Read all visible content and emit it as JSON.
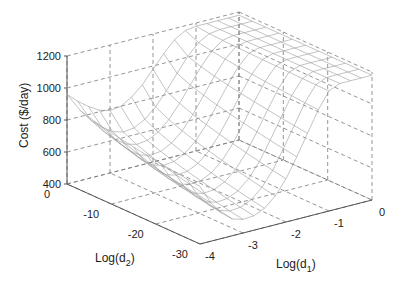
{
  "chart_data": {
    "type": "surface3d",
    "title": "",
    "xlabel": "Log(d1)",
    "ylabel": "Log(d2)",
    "zlabel": "Cost ($/day)",
    "xlabel_parts": {
      "base": "Log(d",
      "sub": "1",
      "close": ")"
    },
    "ylabel_parts": {
      "base": "Log(d",
      "sub": "2",
      "close": ")"
    },
    "xlim": [
      -4,
      0
    ],
    "ylim": [
      -30,
      0
    ],
    "zlim": [
      400,
      1200
    ],
    "x_ticks": [
      -4,
      -3,
      -2,
      -1,
      0
    ],
    "y_ticks": [
      -30,
      -20,
      -10,
      0
    ],
    "z_ticks": [
      400,
      600,
      800,
      1000,
      1200
    ],
    "grid": true,
    "x": [
      -4.0,
      -3.75,
      -3.5,
      -3.25,
      -3.0,
      -2.75,
      -2.5,
      -2.25,
      -2.0,
      -1.75,
      -1.5,
      -1.25,
      -1.0,
      -0.75,
      -0.5,
      -0.25,
      0.0
    ],
    "y": [
      0,
      -3,
      -6,
      -9,
      -12,
      -15,
      -18,
      -21,
      -24,
      -27,
      -30
    ],
    "z_description": "Cost surface: ~1180 for Log(d1) >= -1.5 across all Log(d2); valley minimum ~480-520 near Log(d1) = -3 for Log(d2) <= -15; ~950-1000 at Log(d1) = -4, Log(d2) = 0",
    "z_profile_at_y0": [
      960,
      900,
      850,
      810,
      790,
      800,
      840,
      900,
      980,
      1060,
      1130,
      1170,
      1180,
      1180,
      1180,
      1180,
      1180
    ],
    "z_profile_at_y_min": [
      760,
      640,
      560,
      505,
      485,
      490,
      520,
      580,
      670,
      790,
      920,
      1050,
      1150,
      1180,
      1180,
      1180,
      1180
    ],
    "colors": {
      "surface": "#9a9a9a",
      "box": "#7a7a7a",
      "axis": "#555555",
      "text": "#222222"
    }
  }
}
